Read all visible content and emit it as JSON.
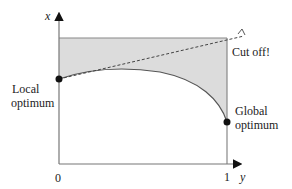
{
  "diagram": {
    "axes": {
      "x_axis_label": "y",
      "y_axis_label": "x",
      "tick_zero": "0",
      "tick_one": "1"
    },
    "annotations": {
      "local_optimum_line1": "Local",
      "local_optimum_line2": "optimum",
      "global_optimum_line1": "Global",
      "global_optimum_line2": "optimum",
      "cut_off": "Cut off!"
    },
    "colors": {
      "shade": "#d9d9d9",
      "line": "#555555",
      "point": "#111111"
    }
  }
}
